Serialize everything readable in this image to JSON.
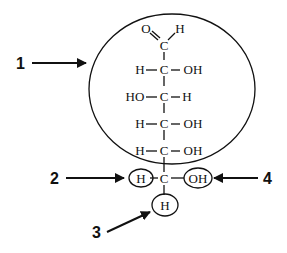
{
  "diagram": {
    "type": "chemical-structure",
    "molecule": "glucose-fischer-projection",
    "top": {
      "left": "O",
      "center": "C",
      "right": "H"
    },
    "rows": [
      {
        "left": "H",
        "center": "C",
        "right": "OH"
      },
      {
        "left": "HO",
        "center": "C",
        "right": "H"
      },
      {
        "left": "H",
        "center": "C",
        "right": "OH"
      },
      {
        "left": "H",
        "center": "C",
        "right": "OH"
      }
    ],
    "bottom": {
      "left": "H",
      "center": "C",
      "right": "OH",
      "below": "H"
    },
    "callouts": [
      {
        "id": "1",
        "label": "1",
        "target": "large circle around upper chain"
      },
      {
        "id": "2",
        "label": "2",
        "target": "circled H on bottom carbon"
      },
      {
        "id": "3",
        "label": "3",
        "target": "circled H below bottom carbon"
      },
      {
        "id": "4",
        "label": "4",
        "target": "circled OH on bottom carbon"
      }
    ]
  }
}
